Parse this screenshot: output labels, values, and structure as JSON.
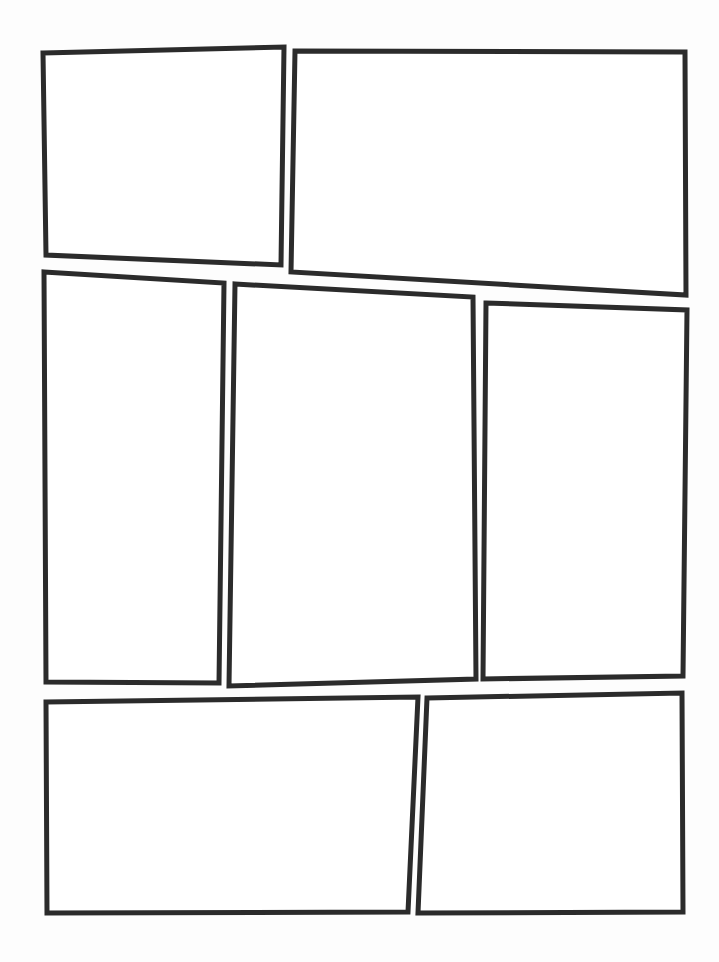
{
  "page": {
    "title": "Blank Comic Book Page Template",
    "width": 719,
    "height": 962,
    "background_color": "#fdfdfd",
    "paper_color": "#ffffff",
    "border_color": "#2b2b2b",
    "border_width": 5,
    "panel_count": 7,
    "row_count": 3
  },
  "panels": [
    {
      "id": "panel-1",
      "label": "Panel 1",
      "row": 1,
      "position_in_row": 1,
      "fill": "#ffffff",
      "stroke": "#2b2b2b",
      "stroke_width": 5,
      "points": "43,53 284,47 281,265 46,255"
    },
    {
      "id": "panel-2",
      "label": "Panel 2",
      "row": 1,
      "position_in_row": 2,
      "fill": "#ffffff",
      "stroke": "#2b2b2b",
      "stroke_width": 5,
      "points": "295,51 685,52 686,295 291,272"
    },
    {
      "id": "panel-3",
      "label": "Panel 3",
      "row": 2,
      "position_in_row": 1,
      "fill": "#ffffff",
      "stroke": "#2b2b2b",
      "stroke_width": 5,
      "points": "44,272 224,283 219,683 46,682"
    },
    {
      "id": "panel-4",
      "label": "Panel 4",
      "row": 2,
      "position_in_row": 2,
      "fill": "#ffffff",
      "stroke": "#2b2b2b",
      "stroke_width": 5,
      "points": "235,284 473,297 476,679 229,686"
    },
    {
      "id": "panel-5",
      "label": "Panel 5",
      "row": 2,
      "position_in_row": 3,
      "fill": "#ffffff",
      "stroke": "#2b2b2b",
      "stroke_width": 5,
      "points": "486,303 687,310 683,676 483,679"
    },
    {
      "id": "panel-6",
      "label": "Panel 6",
      "row": 3,
      "position_in_row": 1,
      "fill": "#ffffff",
      "stroke": "#2b2b2b",
      "stroke_width": 5,
      "points": "46,702 418,697 408,912 47,913"
    },
    {
      "id": "panel-7",
      "label": "Panel 7",
      "row": 3,
      "position_in_row": 2,
      "fill": "#ffffff",
      "stroke": "#2b2b2b",
      "stroke_width": 5,
      "points": "427,698 682,693 683,912 418,913"
    }
  ]
}
